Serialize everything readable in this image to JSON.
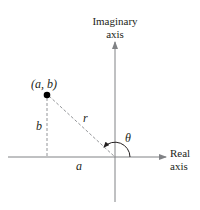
{
  "diagram": {
    "type": "complex-plane-polar-form",
    "axes": {
      "imaginary": {
        "label_line1": "Imaginary",
        "label_line2": "axis"
      },
      "real": {
        "label_line1": "Real",
        "label_line2": "axis"
      }
    },
    "point": {
      "label": "(a, b)"
    },
    "segments": {
      "horizontal": {
        "label": "a"
      },
      "vertical": {
        "label": "b"
      },
      "radius": {
        "label": "r"
      }
    },
    "angle": {
      "label": "θ"
    },
    "colors": {
      "axis": "#808285",
      "dashed": "#939598",
      "text": "#231f20",
      "point": "#000000"
    }
  }
}
